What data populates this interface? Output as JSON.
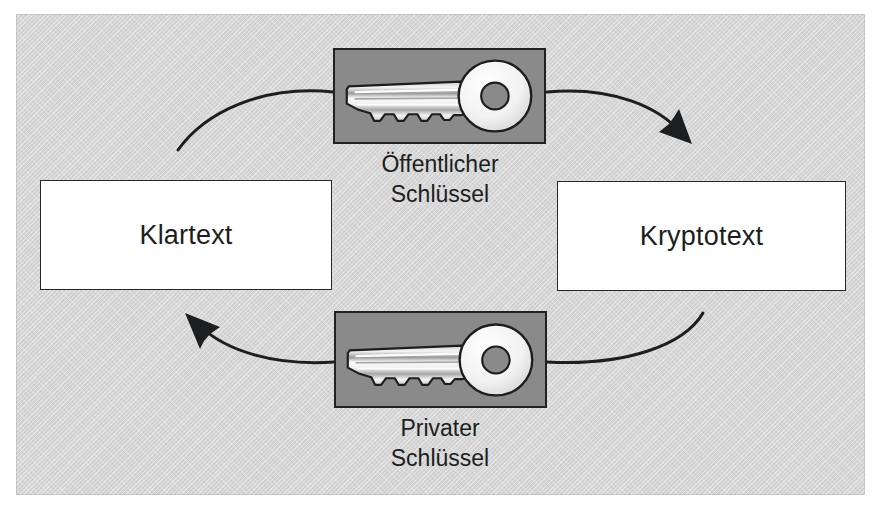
{
  "figure": {
    "language": "de",
    "background_color": "#d6d6d6",
    "key_panel_color": "#8a8a8a",
    "box_fill_color": "#ffffff",
    "line_color": "#1c1e20"
  },
  "boxes": {
    "plaintext": {
      "label": "Klartext"
    },
    "ciphertext": {
      "label": "Kryptotext"
    }
  },
  "keys": {
    "public": {
      "caption_line1": "Öffentlicher",
      "caption_line2": "Schlüssel",
      "icon": "key-icon"
    },
    "private": {
      "caption_line1": "Privater",
      "caption_line2": "Schlüssel",
      "icon": "key-icon"
    }
  },
  "arrows": {
    "encrypt_in": {
      "from": "plaintext",
      "to": "public-key",
      "arrowhead": false
    },
    "encrypt_out": {
      "from": "public-key",
      "to": "ciphertext",
      "arrowhead": true
    },
    "decrypt_in": {
      "from": "ciphertext",
      "to": "private-key",
      "arrowhead": false
    },
    "decrypt_out": {
      "from": "private-key",
      "to": "plaintext",
      "arrowhead": true
    }
  }
}
